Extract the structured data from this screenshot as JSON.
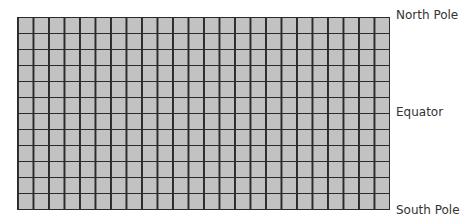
{
  "diagram": {
    "type": "latitude-longitude-grid",
    "columns": 24,
    "rows": 12,
    "colors": {
      "cell_fill": "#c2c2c2",
      "grid_line": "#2b2b2b",
      "label_text": "#333333"
    }
  },
  "labels": {
    "north": "North Pole",
    "equator": "Equator",
    "south": "South Pole"
  }
}
